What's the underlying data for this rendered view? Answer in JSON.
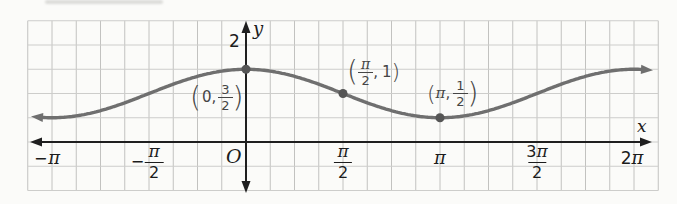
{
  "chart_data": {
    "type": "line",
    "curve": {
      "formula": "y = 1 + (1/2)cos x",
      "midline": 1,
      "amplitude": 0.5,
      "period_rad": 6.2832
    },
    "x_domain_drawn_rad": [
      -3.37,
      6.48
    ],
    "xlabel": "x",
    "ylabel": "y",
    "origin_label": "O",
    "x_ticks": [
      {
        "value": -3.1416,
        "label": "−π"
      },
      {
        "value": -1.5708,
        "label": "−π/2"
      },
      {
        "value": 1.5708,
        "label": "π/2"
      },
      {
        "value": 3.1416,
        "label": "π"
      },
      {
        "value": 4.7124,
        "label": "3π/2"
      },
      {
        "value": 6.2832,
        "label": "2π"
      }
    ],
    "y_ticks": [
      {
        "value": 2,
        "label": "2"
      }
    ],
    "labeled_points": [
      {
        "x": 0,
        "y": 1.5,
        "label": "(0, 3/2)"
      },
      {
        "x": 1.5708,
        "y": 1,
        "label": "(π/2, 1)"
      },
      {
        "x": 3.1416,
        "y": 0.5,
        "label": "(π, 1/2)"
      }
    ],
    "grid": true,
    "axis_arrows": "both ends of x-axis and y-axis; curve has arrowheads at both ends",
    "colors": {
      "curve": "#6f6f6f",
      "point": "#555555",
      "axis": "#1f1f1f",
      "grid_vertical": "#c2c2c0",
      "grid_horizontal": "#cdcdcb",
      "tick_label": "#1c1c1c",
      "point_label": "#454545",
      "background": "#fbfbf9"
    }
  },
  "labels": {
    "y_axis": "y",
    "x_axis": "x",
    "origin": "O",
    "y_tick": "2",
    "tick_neg_pi": {
      "minus": "−",
      "pi": "π"
    },
    "tick_neg_pi_2": {
      "minus": "−",
      "num": "π",
      "den": "2"
    },
    "tick_pi_2": {
      "num": "π",
      "den": "2"
    },
    "tick_pi": "π",
    "tick_3pi_2": {
      "num3": "3",
      "numpi": "π",
      "den": "2"
    },
    "tick_2pi": {
      "two": "2",
      "pi": "π"
    },
    "point1": {
      "open": "(",
      "pre": "0,",
      "num": "3",
      "den": "2",
      "close": ")"
    },
    "point2": {
      "open": "(",
      "num": "π",
      "den": "2",
      "comma": ",",
      "val": "1",
      "close": ")"
    },
    "point3": {
      "open": "(",
      "pi": "π",
      "comma": ",",
      "num": "1",
      "den": "2",
      "close": ")"
    }
  }
}
